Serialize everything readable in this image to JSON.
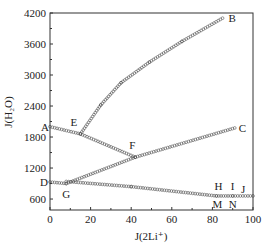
{
  "chart_data": {
    "type": "scatter",
    "title": "",
    "xlabel": "J(2Li⁺)",
    "ylabel": "J(H₂O)",
    "xlim": [
      0,
      100
    ],
    "ylim": [
      388,
      4200
    ],
    "grid": false,
    "legend": null,
    "x_ticks": [
      0,
      20,
      40,
      60,
      80,
      100
    ],
    "y_ticks": [
      600,
      1200,
      1800,
      2400,
      3000,
      3600,
      4200
    ],
    "x_tick_labels": [
      "0",
      "20",
      "40",
      "60",
      "80",
      "100"
    ],
    "y_tick_labels": [
      "600",
      "1200",
      "1800",
      "2400",
      "3000",
      "3600",
      "4200"
    ],
    "marker": "open-circle",
    "series": [
      {
        "name": "A-E-F",
        "points": [
          [
            0,
            2000
          ],
          [
            15,
            1860
          ],
          [
            42,
            1410
          ]
        ]
      },
      {
        "name": "E-B",
        "points": [
          [
            15,
            1860
          ],
          [
            25,
            2420
          ],
          [
            35,
            2850
          ],
          [
            49,
            3250
          ],
          [
            65,
            3650
          ],
          [
            85,
            4100
          ]
        ]
      },
      {
        "name": "G-F-C",
        "points": [
          [
            8,
            900
          ],
          [
            42,
            1410
          ],
          [
            91,
            1975
          ]
        ]
      },
      {
        "name": "D-G",
        "points": [
          [
            0,
            930
          ],
          [
            8,
            900
          ]
        ]
      },
      {
        "name": "G-H",
        "points": [
          [
            8,
            940
          ],
          [
            40,
            840
          ],
          [
            82,
            660
          ]
        ]
      },
      {
        "name": "H-I-J",
        "points": [
          [
            82,
            660
          ],
          [
            90,
            660
          ],
          [
            100,
            660
          ]
        ]
      }
    ],
    "annotations": [
      {
        "text": "A",
        "x": 0,
        "y": 2000
      },
      {
        "text": "B",
        "x": 85,
        "y": 4100
      },
      {
        "text": "C",
        "x": 91,
        "y": 1975
      },
      {
        "text": "D",
        "x": 0,
        "y": 930
      },
      {
        "text": "E",
        "x": 15,
        "y": 1860
      },
      {
        "text": "F",
        "x": 42,
        "y": 1410
      },
      {
        "text": "G",
        "x": 8,
        "y": 900
      },
      {
        "text": "H",
        "x": 82,
        "y": 660
      },
      {
        "text": "I",
        "x": 90,
        "y": 660
      },
      {
        "text": "J",
        "x": 100,
        "y": 660
      },
      {
        "text": "M",
        "x": 82,
        "y": 660
      },
      {
        "text": "N",
        "x": 90,
        "y": 660
      }
    ]
  },
  "labels": {
    "x_axis": "J(2Li⁺)",
    "y_axis": "J(H₂O)"
  }
}
